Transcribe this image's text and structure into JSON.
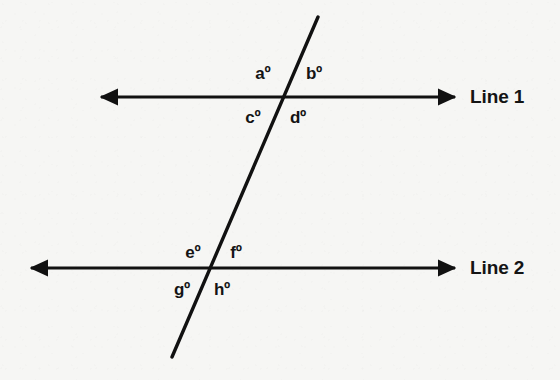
{
  "figure": {
    "background_color": "#f6f6f4",
    "stroke_color": "#111111",
    "stroke_width": 3,
    "line_labels": [
      {
        "id": "line1",
        "text": "Line 1",
        "x": 470,
        "y": 97
      },
      {
        "id": "line2",
        "text": "Line 2",
        "x": 470,
        "y": 268
      }
    ],
    "lines": [
      {
        "id": "line1",
        "name": "line-1",
        "orientation": "horizontal",
        "y": 97,
        "x_start": 98,
        "x_end": 458,
        "arrow_start": true,
        "arrow_end": true
      },
      {
        "id": "line2",
        "name": "line-2",
        "orientation": "horizontal",
        "y": 268,
        "x_start": 28,
        "x_end": 458,
        "arrow_start": true,
        "arrow_end": true
      },
      {
        "id": "transversal",
        "name": "transversal-line",
        "orientation": "oblique",
        "x_start": 318,
        "y_start": 17,
        "x_end": 172,
        "y_end": 357,
        "arrow_start": false,
        "arrow_end": false
      }
    ],
    "intersections": [
      {
        "id": "upper",
        "x": 290,
        "y": 97,
        "on_line": "Line 1"
      },
      {
        "id": "lower",
        "x": 212,
        "y": 268,
        "on_line": "Line 2"
      }
    ],
    "angle_labels": [
      {
        "id": "a",
        "text": "aº",
        "x": 263,
        "y": 74,
        "intersection": "upper",
        "position": "above-left"
      },
      {
        "id": "b",
        "text": "bº",
        "x": 314,
        "y": 74,
        "intersection": "upper",
        "position": "above-right"
      },
      {
        "id": "c",
        "text": "cº",
        "x": 253,
        "y": 118,
        "intersection": "upper",
        "position": "below-left"
      },
      {
        "id": "d",
        "text": "dº",
        "x": 298,
        "y": 118,
        "intersection": "upper",
        "position": "below-right"
      },
      {
        "id": "e",
        "text": "eº",
        "x": 193,
        "y": 253,
        "intersection": "lower",
        "position": "above-left"
      },
      {
        "id": "f",
        "text": "fº",
        "x": 236,
        "y": 253,
        "intersection": "lower",
        "position": "above-right"
      },
      {
        "id": "g",
        "text": "gº",
        "x": 182,
        "y": 290,
        "intersection": "lower",
        "position": "below-left"
      },
      {
        "id": "h",
        "text": "hº",
        "x": 222,
        "y": 290,
        "intersection": "lower",
        "position": "below-right"
      }
    ]
  }
}
